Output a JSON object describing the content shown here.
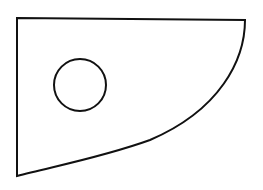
{
  "diagram": {
    "width": 263,
    "height": 190,
    "background": "#ffffff",
    "stroke_color": "#111111",
    "stroke_width": 2,
    "shapes": [
      {
        "id": "outer-shape",
        "type": "path",
        "description": "Quadrilateral-like region with straight top edge, straight left edge, and a concave curved edge from bottom-left to top-right",
        "points": {
          "top_left": [
            17,
            18
          ],
          "top_right": [
            245,
            20
          ],
          "bottom_left": [
            17,
            176
          ]
        },
        "curve_control_points": [
          [
            170,
            140
          ],
          [
            240,
            90
          ]
        ],
        "d": "M17,18 L245,20 C245,60 220,110 150,140 C100,158 50,167 17,176 Z"
      },
      {
        "id": "inner-circle",
        "type": "circle",
        "cx": 80,
        "cy": 85,
        "r": 26
      }
    ]
  }
}
